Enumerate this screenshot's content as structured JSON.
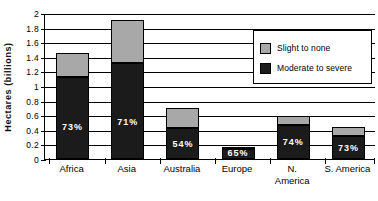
{
  "chart_data": {
    "type": "bar",
    "subtype": "stacked-column",
    "title": "",
    "xlabel": "",
    "ylabel": "Hectares  (billions)",
    "ylim": [
      0,
      2
    ],
    "ytick_step": 0.2,
    "ytick_labels": [
      "0",
      "0.2",
      "0.4",
      "0.6",
      "0.8",
      "1",
      "1.2",
      "1.4",
      "1.6",
      "1.8",
      "2"
    ],
    "grid": true,
    "grid_axis": "y",
    "legend_position": "top-right",
    "categories": [
      "Africa",
      "Asia",
      "Australia",
      "Europe",
      "N. America",
      "S. America"
    ],
    "series": [
      {
        "name": "Moderate to severe",
        "color": "#1b1b1b",
        "values": [
          1.12,
          1.31,
          0.42,
          0.135,
          0.47,
          0.315
        ]
      },
      {
        "name": "Slight to none",
        "color": "#a8a8a8",
        "values": [
          0.33,
          0.6,
          0.28,
          0.02,
          0.12,
          0.13
        ]
      }
    ],
    "totals": [
      1.45,
      1.91,
      0.7,
      0.155,
      0.59,
      0.445
    ],
    "data_labels": [
      "73%",
      "71%",
      "54%",
      "65%",
      "74%",
      "73%"
    ],
    "data_label_note": "percent share of Moderate to severe within each column"
  },
  "axis": {
    "y_title": "Hectares  (billions)",
    "y_ticks": [
      "2",
      "1.8",
      "1.6",
      "1.4",
      "1.2",
      "1",
      "0.8",
      "0.6",
      "0.4",
      "0.2",
      "0"
    ]
  },
  "legend": {
    "items": [
      {
        "label": "Slight to none",
        "swatch": "#a8a8a8"
      },
      {
        "label": "Moderate to severe",
        "swatch": "#1b1b1b"
      }
    ]
  },
  "categories_display": [
    {
      "label": "Africa"
    },
    {
      "label": "Asia"
    },
    {
      "label": "Australia"
    },
    {
      "label": "Europe"
    },
    {
      "label": "N.\nAmerica"
    },
    {
      "label": "S. America"
    }
  ]
}
